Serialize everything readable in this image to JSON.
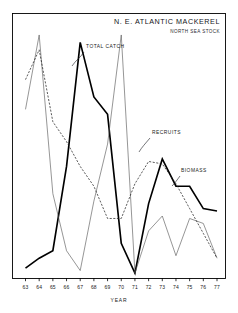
{
  "chart_data": {
    "type": "line",
    "title": "N. E. ATLANTIC MACKEREL",
    "subtitle": "NORTH SEA STOCK",
    "xlabel": "YEAR",
    "ylabel": "",
    "grid": false,
    "legend_position": "inline-annotations",
    "xlim": [
      62.5,
      77.8
    ],
    "ylim": [
      0,
      100
    ],
    "categories": [
      "63",
      "64",
      "65",
      "66",
      "67",
      "68",
      "69",
      "70",
      "71",
      "72",
      "73",
      "74",
      "75",
      "76",
      "77"
    ],
    "tick_labels": [
      "63",
      "64",
      "65",
      "66",
      "67",
      "68",
      "69",
      "70",
      "71",
      "72",
      "73",
      "74",
      "75",
      "76",
      "77"
    ],
    "series": [
      {
        "name": "TOTAL CATCH",
        "style": "solid-thick",
        "color": "#000000",
        "x": [
          63,
          64,
          65,
          66,
          67,
          68,
          69,
          70,
          71,
          72,
          73,
          74,
          75,
          76,
          77
        ],
        "values": [
          4,
          8,
          11,
          45,
          95,
          73,
          66,
          14,
          2,
          30,
          48,
          37,
          37,
          28,
          27
        ]
      },
      {
        "name": "RECRUITS",
        "style": "solid-thin",
        "color": "#555555",
        "x": [
          63,
          64,
          65,
          66,
          67,
          68,
          69,
          70,
          71,
          72,
          73,
          74,
          75,
          76,
          77
        ],
        "values": [
          68,
          98,
          34,
          11,
          3,
          31,
          54,
          98,
          2,
          19,
          25,
          9,
          24,
          22,
          8
        ]
      },
      {
        "name": "BIOMASS",
        "style": "dashed",
        "color": "#1a1a1a",
        "x": [
          63,
          64,
          65,
          66,
          67,
          68,
          69,
          70,
          71,
          72,
          73,
          74,
          75,
          76,
          77
        ],
        "values": [
          80,
          92,
          63,
          55,
          45,
          37,
          24,
          24,
          38,
          47,
          46,
          38,
          28,
          18,
          8
        ]
      }
    ],
    "annotations": [
      {
        "label": "TOTAL CATCH",
        "x_px": 86,
        "y_px": 48
      },
      {
        "label": "RECRUITS",
        "x_px": 152,
        "y_px": 134
      },
      {
        "label": "BIOMASS",
        "x_px": 181,
        "y_px": 172
      }
    ]
  },
  "figure": {
    "border_color": "#000000",
    "background": "#ffffff"
  }
}
